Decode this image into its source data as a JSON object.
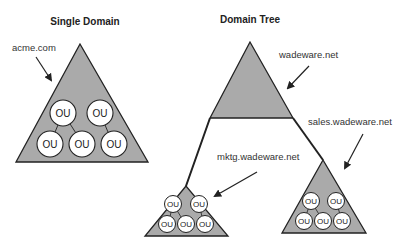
{
  "diagram": {
    "fill_color": "#aaaaaa",
    "stroke_color": "#222222",
    "single_domain": {
      "title": "Single Domain",
      "domain_label": "acme.com",
      "ous": [
        "OU",
        "OU",
        "OU",
        "OU",
        "OU"
      ]
    },
    "domain_tree": {
      "title": "Domain Tree",
      "root": {
        "label": "wadeware.net"
      },
      "children": [
        {
          "label": "mktg.wadeware.net",
          "ous": [
            "OU",
            "OU",
            "OU",
            "OU",
            "OU"
          ]
        },
        {
          "label": "sales.wadeware.net",
          "ous": [
            "OU",
            "OU",
            "OU",
            "OU",
            "OU"
          ]
        }
      ]
    }
  }
}
